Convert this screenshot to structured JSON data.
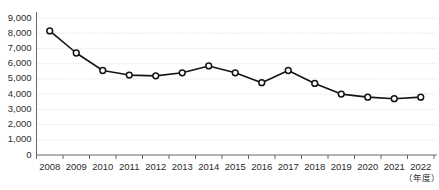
{
  "chart_data": {
    "type": "line",
    "title": "",
    "xlabel": "（年度）",
    "ylabel": "",
    "categories": [
      "2008",
      "2009",
      "2010",
      "2011",
      "2012",
      "2013",
      "2014",
      "2015",
      "2016",
      "2017",
      "2018",
      "2019",
      "2020",
      "2021",
      "2022"
    ],
    "values": [
      8150,
      6700,
      5550,
      5250,
      5200,
      5400,
      5850,
      5400,
      4750,
      5550,
      4700,
      4000,
      3800,
      3700,
      3800
    ],
    "series": [
      {
        "name": "件数",
        "values": [
          8150,
          6700,
          5550,
          5250,
          5200,
          5400,
          5850,
          5400,
          4750,
          5550,
          4700,
          4000,
          3800,
          3700,
          3800
        ]
      }
    ],
    "ylim": [
      0,
      9000
    ],
    "ytick_labels": [
      "9,000",
      "8,000",
      "7,000",
      "6,000",
      "5,000",
      "4,000",
      "3,000",
      "2,000",
      "1,000",
      "0"
    ],
    "ytick_values": [
      9000,
      8000,
      7000,
      6000,
      5000,
      4000,
      3000,
      2000,
      1000,
      0
    ],
    "grid": true,
    "grid_axis": "y",
    "legend": "none",
    "marker": "open-circle",
    "colors": {
      "line": "#141414",
      "marker_fill": "#ffffff",
      "marker_stroke": "#141414",
      "grid": "#c9c9c9",
      "axis": "#555555",
      "text": "#2b2b2b",
      "background": "#ffffff"
    }
  }
}
